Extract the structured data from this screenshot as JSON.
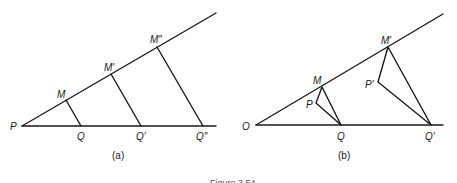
{
  "figure": {
    "caption": "Figure 3.54",
    "panels": [
      {
        "id": "a",
        "label": "(a)",
        "points": {
          "P": "P",
          "M": "M",
          "M1": "M′",
          "M2": "M″",
          "Q": "Q",
          "Q1": "Q′",
          "Q2": "Q″"
        }
      },
      {
        "id": "b",
        "label": "(b)",
        "points": {
          "O": "O",
          "M": "M",
          "P": "P",
          "Q": "Q",
          "M1": "M′",
          "P1": "P′",
          "Q1": "Q′"
        }
      }
    ]
  },
  "colors": {
    "ink": "#1a1a1a",
    "background": "#ffffff"
  }
}
